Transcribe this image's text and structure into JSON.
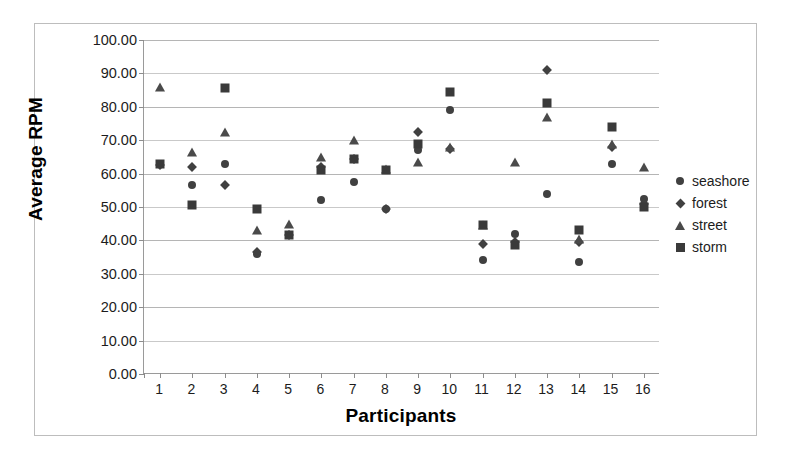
{
  "chart_data": {
    "type": "scatter",
    "title": "",
    "xlabel": "Participants",
    "ylabel": "Average RPM",
    "xlim": [
      0.5,
      16.5
    ],
    "ylim": [
      0,
      100
    ],
    "grid": true,
    "legend_position": "right",
    "y_ticks": [
      "0.00",
      "10.00",
      "20.00",
      "30.00",
      "40.00",
      "50.00",
      "60.00",
      "70.00",
      "80.00",
      "90.00",
      "100.00"
    ],
    "y_tick_values": [
      0,
      10,
      20,
      30,
      40,
      50,
      60,
      70,
      80,
      90,
      100
    ],
    "categories": [
      1,
      2,
      3,
      4,
      5,
      6,
      7,
      8,
      9,
      10,
      11,
      12,
      13,
      14,
      15,
      16
    ],
    "x_tick_labels": [
      "1",
      "2",
      "3",
      "4",
      "5",
      "6",
      "7",
      "8",
      "9",
      "10",
      "11",
      "12",
      "13",
      "14",
      "15",
      "16"
    ],
    "series": [
      {
        "name": "seashore",
        "marker": "circle",
        "color": "#404040",
        "values": [
          63.0,
          56.5,
          63.0,
          36.0,
          41.5,
          52.0,
          57.5,
          49.5,
          67.0,
          79.0,
          34.0,
          42.0,
          54.0,
          33.5,
          63.0,
          52.5
        ]
      },
      {
        "name": "forest",
        "marker": "diamond",
        "color": "#404040",
        "values": [
          62.5,
          62.0,
          56.5,
          36.5,
          41.5,
          62.0,
          64.5,
          49.5,
          72.5,
          67.5,
          39.0,
          39.5,
          91.0,
          39.5,
          68.0,
          51.0
        ]
      },
      {
        "name": "street",
        "marker": "triangle",
        "color": "#4a4a4a",
        "values": [
          86.0,
          66.5,
          72.5,
          43.0,
          45.0,
          65.0,
          70.0,
          61.5,
          63.5,
          68.0,
          44.5,
          63.5,
          77.0,
          40.5,
          69.0,
          62.0
        ]
      },
      {
        "name": "storm",
        "marker": "square",
        "color": "#3a3a3a",
        "values": [
          63.0,
          50.5,
          85.5,
          49.5,
          41.5,
          61.0,
          64.5,
          61.0,
          69.0,
          84.5,
          44.5,
          38.5,
          81.0,
          43.0,
          74.0,
          50.0
        ]
      }
    ]
  },
  "legend": {
    "items": [
      {
        "label": "seashore",
        "marker": "circle"
      },
      {
        "label": "forest",
        "marker": "diamond"
      },
      {
        "label": "street",
        "marker": "triangle"
      },
      {
        "label": "storm",
        "marker": "square"
      }
    ]
  }
}
